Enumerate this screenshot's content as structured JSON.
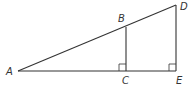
{
  "diagram": {
    "type": "similar-right-triangles",
    "points": {
      "A": {
        "label": "A",
        "x": 18,
        "y": 71
      },
      "B": {
        "label": "B",
        "x": 126,
        "y": 27
      },
      "C": {
        "label": "C",
        "x": 126,
        "y": 71
      },
      "D": {
        "label": "D",
        "x": 176,
        "y": 5
      },
      "E": {
        "label": "E",
        "x": 176,
        "y": 71
      }
    },
    "segments": [
      "AD",
      "AE",
      "BC",
      "DE"
    ],
    "right_angles": [
      "C",
      "E"
    ],
    "colors": {
      "stroke": "#333333",
      "background": "#ffffff"
    }
  }
}
